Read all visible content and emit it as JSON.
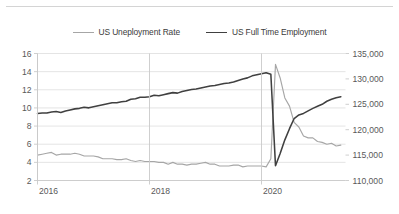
{
  "chart_data": {
    "type": "line",
    "title": "",
    "subtitle": "",
    "xlabel": "",
    "ylabel": "",
    "grid": true,
    "legend_position": "top-center",
    "x_tick_labels": [
      "2016",
      "2018",
      "2020"
    ],
    "x_tick_values": [
      2016.0,
      2018.0,
      2020.0
    ],
    "x_range": [
      2016.0,
      2021.5
    ],
    "left_axis": {
      "label": "",
      "ylim": [
        2,
        16
      ],
      "tick_labels": [
        "2",
        "4",
        "6",
        "8",
        "10",
        "12",
        "14",
        "16"
      ],
      "tick_values": [
        2,
        4,
        6,
        8,
        10,
        12,
        14,
        16
      ]
    },
    "right_axis": {
      "label": "",
      "ylim": [
        110000,
        135000
      ],
      "tick_labels": [
        "110,000",
        "115,000",
        "120,000",
        "125,000",
        "130,000",
        "135,000"
      ],
      "tick_values": [
        110000,
        115000,
        120000,
        125000,
        130000,
        135000
      ]
    },
    "series": [
      {
        "name": "US Uneployment Rate",
        "axis": "left",
        "color": "#a6a6a6",
        "x": [
          2016.0,
          2016.083,
          2016.167,
          2016.25,
          2016.333,
          2016.417,
          2016.5,
          2016.583,
          2016.667,
          2016.75,
          2016.833,
          2016.917,
          2017.0,
          2017.083,
          2017.167,
          2017.25,
          2017.333,
          2017.417,
          2017.5,
          2017.583,
          2017.667,
          2017.75,
          2017.833,
          2017.917,
          2018.0,
          2018.083,
          2018.167,
          2018.25,
          2018.333,
          2018.417,
          2018.5,
          2018.583,
          2018.667,
          2018.75,
          2018.833,
          2018.917,
          2019.0,
          2019.083,
          2019.167,
          2019.25,
          2019.333,
          2019.417,
          2019.5,
          2019.583,
          2019.667,
          2019.75,
          2019.833,
          2019.917,
          2020.0,
          2020.083,
          2020.167,
          2020.25,
          2020.333,
          2020.417,
          2020.5,
          2020.583,
          2020.667,
          2020.75,
          2020.833,
          2020.917,
          2021.0,
          2021.083,
          2021.167,
          2021.25,
          2021.333,
          2021.417
        ],
        "values": [
          4.8,
          4.9,
          5.0,
          5.1,
          4.8,
          4.9,
          4.9,
          4.9,
          5.0,
          4.9,
          4.7,
          4.7,
          4.7,
          4.6,
          4.4,
          4.4,
          4.4,
          4.3,
          4.3,
          4.4,
          4.2,
          4.1,
          4.2,
          4.1,
          4.1,
          4.1,
          4.0,
          4.0,
          3.8,
          4.0,
          3.8,
          3.8,
          3.7,
          3.8,
          3.8,
          3.9,
          4.0,
          3.8,
          3.8,
          3.6,
          3.6,
          3.6,
          3.7,
          3.7,
          3.5,
          3.6,
          3.6,
          3.6,
          3.6,
          3.5,
          4.4,
          14.8,
          13.3,
          11.1,
          10.2,
          8.4,
          7.9,
          6.9,
          6.7,
          6.7,
          6.3,
          6.2,
          6.0,
          6.1,
          5.8,
          5.9
        ]
      },
      {
        "name": "US Full Time Employment",
        "axis": "right",
        "color": "#404040",
        "x": [
          2016.0,
          2016.083,
          2016.167,
          2016.25,
          2016.333,
          2016.417,
          2016.5,
          2016.583,
          2016.667,
          2016.75,
          2016.833,
          2016.917,
          2017.0,
          2017.083,
          2017.167,
          2017.25,
          2017.333,
          2017.417,
          2017.5,
          2017.583,
          2017.667,
          2017.75,
          2017.833,
          2017.917,
          2018.0,
          2018.083,
          2018.167,
          2018.25,
          2018.333,
          2018.417,
          2018.5,
          2018.583,
          2018.667,
          2018.75,
          2018.833,
          2018.917,
          2019.0,
          2019.083,
          2019.167,
          2019.25,
          2019.333,
          2019.417,
          2019.5,
          2019.583,
          2019.667,
          2019.75,
          2019.833,
          2019.917,
          2020.0,
          2020.083,
          2020.167,
          2020.25,
          2020.333,
          2020.417,
          2020.5,
          2020.583,
          2020.667,
          2020.75,
          2020.833,
          2020.917,
          2021.0,
          2021.083,
          2021.167,
          2021.25,
          2021.333,
          2021.417
        ],
        "values": [
          123200,
          123300,
          123300,
          123500,
          123600,
          123400,
          123700,
          123900,
          124100,
          124200,
          124400,
          124300,
          124500,
          124700,
          124900,
          125100,
          125300,
          125300,
          125500,
          125600,
          126000,
          126100,
          126400,
          126400,
          126500,
          126800,
          126700,
          126900,
          127100,
          127300,
          127200,
          127500,
          127700,
          127900,
          128000,
          128200,
          128400,
          128600,
          128700,
          128900,
          129100,
          129200,
          129400,
          129700,
          130000,
          130200,
          130600,
          130800,
          131000,
          131200,
          130900,
          112900,
          115300,
          118000,
          120200,
          122200,
          122900,
          123200,
          123700,
          124200,
          124600,
          125000,
          125600,
          126000,
          126300,
          126500
        ]
      }
    ]
  },
  "legend": {
    "items": [
      {
        "label": "US Uneployment Rate",
        "color": "#a6a6a6"
      },
      {
        "label": "US Full Time Employment",
        "color": "#404040"
      }
    ]
  }
}
